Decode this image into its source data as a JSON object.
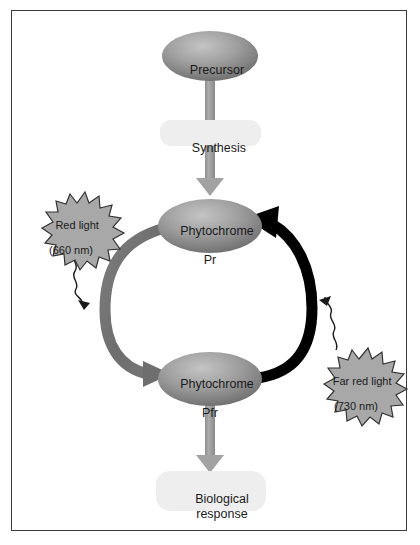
{
  "figure": {
    "background_color": "#ffffff",
    "border_color": "#3b3b3b"
  },
  "nodes": {
    "precursor": {
      "label": "Precursor",
      "shape": "ellipse",
      "fill_light": "#b4b4b4",
      "fill_dark": "#6f6f6f"
    },
    "phytochrome_pr": {
      "label_line1": "Phytochrome",
      "label_line2": "Pr",
      "shape": "ellipse",
      "fill_light": "#b4b4b4",
      "fill_dark": "#6f6f6f"
    },
    "phytochrome_pfr": {
      "label_line1": "Phytochrome",
      "label_line2": "Pfr",
      "shape": "ellipse",
      "fill_light": "#b4b4b4",
      "fill_dark": "#6f6f6f"
    }
  },
  "boxes": {
    "synthesis": {
      "label": "Synthesis",
      "fill": "#eeeeee"
    },
    "biological_response": {
      "label_line1": "Biological",
      "label_line2": "response",
      "fill": "#eeeeee"
    }
  },
  "bursts": {
    "red_light": {
      "label_line1": "Red light",
      "label_line2": "(660 nm)",
      "fill": "#a8a8a8",
      "stroke": "#333333"
    },
    "far_red_light": {
      "label_line1": "Far red light",
      "label_line2": "(730 nm)",
      "fill": "#a8a8a8",
      "stroke": "#333333"
    }
  },
  "arrows": {
    "synthesis_arrow": {
      "name": "Synthesis",
      "from": "Precursor",
      "to": "Phytochrome Pr",
      "color": "#9a9a9a",
      "style": "straight-down"
    },
    "pr_to_pfr_arrow": {
      "name": "Red light conversion",
      "from": "Phytochrome Pr",
      "to": "Phytochrome Pfr",
      "color": "#6e6e6e",
      "style": "curved-left"
    },
    "pfr_to_pr_arrow": {
      "name": "Far red light conversion",
      "from": "Phytochrome Pfr",
      "to": "Phytochrome Pr",
      "color": "#000000",
      "style": "curved-right"
    },
    "response_arrow": {
      "name": "Biological response",
      "from": "Phytochrome Pfr",
      "to": "Biological response",
      "color": "#9a9a9a",
      "style": "straight-down"
    },
    "red_light_squiggle": {
      "name": "Red light excitation",
      "color": "#1a1a1a",
      "style": "wavy"
    },
    "far_red_light_squiggle": {
      "name": "Far red light excitation",
      "color": "#1a1a1a",
      "style": "wavy"
    }
  }
}
